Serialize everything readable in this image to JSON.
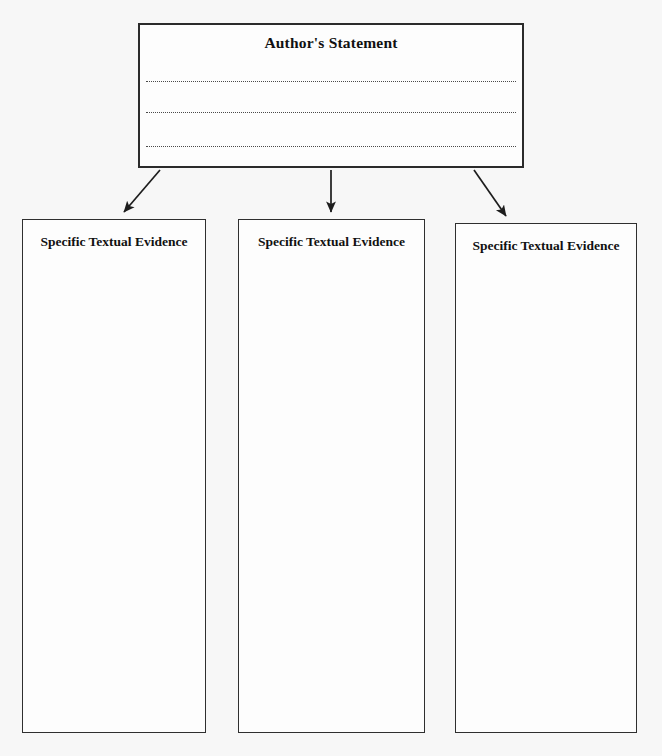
{
  "page": {
    "background_color": "#f7f7f7",
    "ink_color": "#111111",
    "document_type": "graphic-organizer-worksheet"
  },
  "statement": {
    "title": "Author's Statement",
    "box_border_color": "#2b2b2b",
    "write_lines": [
      {
        "id": "line-1",
        "style": "dotted"
      },
      {
        "id": "line-2",
        "style": "dotted"
      },
      {
        "id": "line-3",
        "style": "dotted"
      }
    ]
  },
  "connectors": [
    {
      "name": "arrow-to-evidence-1",
      "direction": "down-left",
      "from": [
        160,
        170
      ],
      "to": [
        122,
        214
      ]
    },
    {
      "name": "arrow-to-evidence-2",
      "direction": "down",
      "from": [
        331,
        170
      ],
      "to": [
        331,
        214
      ]
    },
    {
      "name": "arrow-to-evidence-3",
      "direction": "down-right",
      "from": [
        474,
        170
      ],
      "to": [
        508,
        218
      ]
    }
  ],
  "evidence_boxes": [
    {
      "id": "evidence-1",
      "label": "Specific Textual Evidence"
    },
    {
      "id": "evidence-2",
      "label": "Specific Textual Evidence"
    },
    {
      "id": "evidence-3",
      "label": "Specific Textual Evidence"
    }
  ]
}
